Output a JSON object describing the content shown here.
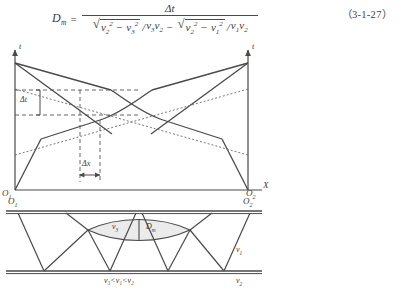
{
  "equation": {
    "lhs_var": "D",
    "lhs_sub": "m",
    "equals": "=",
    "numerator": "Δt",
    "denominator_parts": {
      "rad1_radicand_a": "v",
      "rad1_sub_a": "2",
      "rad1_sup_a": "2",
      "rad1_minus": "−",
      "rad1_radicand_b": "v",
      "rad1_sub_b": "3",
      "rad1_sup_b": "2",
      "div1": "/",
      "div1_v_a": "v",
      "div1_sub_a": "3",
      "div1_v_b": "v",
      "div1_sub_b": "2",
      "operator": "−",
      "rad2_radicand_a": "v",
      "rad2_sub_a": "2",
      "rad2_sup_a": "2",
      "rad2_minus": "−",
      "rad2_radicand_b": "v",
      "rad2_sub_b": "1",
      "rad2_sup_b": "2",
      "div2": "/",
      "div2_v_a": "v",
      "div2_sub_a": "1",
      "div2_v_b": "v",
      "div2_sub_b": "2"
    },
    "number": "（3-1-27）"
  },
  "upper_figure": {
    "t_axis_left_label": "t",
    "t_axis_right_label": "t",
    "x_axis_label": "X",
    "origin_left": "O",
    "origin_left_sub": "1",
    "origin_right": "O",
    "origin_right_sub": "2",
    "delta_t_label": "Δt",
    "delta_x_label": "Δx"
  },
  "lower_figure": {
    "origin_left": "O",
    "origin_left_sub": "1",
    "origin_right": "O",
    "origin_right_sub": "2",
    "lens_velocity_label": "v",
    "lens_velocity_sub": "3",
    "lens_thickness_label": "D",
    "lens_thickness_sub": "m",
    "layer1_velocity": "v",
    "layer1_velocity_sub": "1",
    "layer2_velocity": "v",
    "layer2_velocity_sub": "2",
    "inequality": "v₃<v₁<v₂"
  },
  "colors": {
    "ink": "#3a3a3a",
    "line": "#4a4a4a",
    "lens_fill": "#ebebeb"
  }
}
